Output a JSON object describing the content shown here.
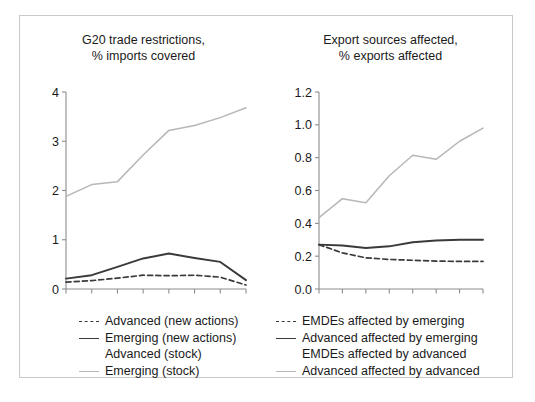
{
  "figure": {
    "background_color": "#ffffff",
    "frame_color": "#c9c9c9",
    "panels": [
      "left",
      "right"
    ]
  },
  "colors": {
    "dark_line": "#3a3a3a",
    "light_line": "#b7b7b7",
    "axis": "#8c8c8c",
    "text": "#1a1a1a",
    "white_line": "#ffffff"
  },
  "chart_data": [
    {
      "id": "left",
      "type": "line",
      "title": "G20 trade restrictions,\n% imports covered",
      "title_line_1": "G20 trade restrictions,",
      "title_line_2": "% imports covered",
      "xlabel": "",
      "ylabel": "",
      "ylim": [
        0,
        4
      ],
      "yticks": [
        0,
        1,
        2,
        3,
        4
      ],
      "ytick_labels": [
        "0",
        "1",
        "2",
        "3",
        "4"
      ],
      "x": [
        0,
        1,
        2,
        3,
        4,
        5,
        6,
        7
      ],
      "xticks": [
        0,
        1,
        2,
        3,
        4,
        5,
        6,
        7
      ],
      "xtick_labels": [
        "",
        "",
        "",
        "",
        "",
        "",
        "",
        ""
      ],
      "grid": false,
      "legend_position": "below",
      "series": [
        {
          "name": "Advanced (new actions)",
          "style": "dashed",
          "color": "#3a3a3a",
          "values": [
            0.14,
            0.17,
            0.22,
            0.28,
            0.27,
            0.28,
            0.24,
            0.08
          ]
        },
        {
          "name": "Emerging (new actions)",
          "style": "solid",
          "color": "#3a3a3a",
          "values": [
            0.21,
            0.28,
            0.45,
            0.62,
            0.72,
            0.63,
            0.55,
            0.18
          ]
        },
        {
          "name": "Advanced (stock)",
          "style": "solid",
          "color": "#ffffff",
          "values": [
            null,
            null,
            null,
            null,
            null,
            null,
            null,
            null
          ]
        },
        {
          "name": "Emerging (stock)",
          "style": "solid",
          "color": "#b7b7b7",
          "values": [
            1.88,
            2.12,
            2.18,
            2.72,
            3.22,
            3.32,
            3.48,
            3.68
          ]
        }
      ]
    },
    {
      "id": "right",
      "type": "line",
      "title": "Export sources affected,\n% exports affected",
      "title_line_1": "Export sources affected,",
      "title_line_2": "% exports affected",
      "xlabel": "",
      "ylabel": "",
      "ylim": [
        0.0,
        1.2
      ],
      "yticks": [
        0.0,
        0.2,
        0.4,
        0.6,
        0.8,
        1.0,
        1.2
      ],
      "ytick_labels": [
        "0.0",
        "0.2",
        "0.4",
        "0.6",
        "0.8",
        "1.0",
        "1.2"
      ],
      "x": [
        0,
        1,
        2,
        3,
        4,
        5,
        6,
        7
      ],
      "xticks": [
        0,
        1,
        2,
        3,
        4,
        5,
        6,
        7
      ],
      "xtick_labels": [
        "",
        "",
        "",
        "",
        "",
        "",
        "",
        ""
      ],
      "grid": false,
      "legend_position": "below",
      "series": [
        {
          "name": "EMDEs affected by emerging",
          "style": "dashed",
          "color": "#3a3a3a",
          "values": [
            0.27,
            0.22,
            0.19,
            0.18,
            0.175,
            0.17,
            0.168,
            0.168
          ]
        },
        {
          "name": "Advanced affected by emerging",
          "style": "solid",
          "color": "#3a3a3a",
          "values": [
            0.27,
            0.265,
            0.25,
            0.26,
            0.285,
            0.295,
            0.3,
            0.3
          ]
        },
        {
          "name": "EMDEs affected by advanced",
          "style": "solid",
          "color": "#ffffff",
          "values": [
            null,
            null,
            null,
            null,
            null,
            null,
            null,
            null
          ]
        },
        {
          "name": "Advanced affected by advanced",
          "style": "solid",
          "color": "#b7b7b7",
          "values": [
            0.435,
            0.55,
            0.525,
            0.69,
            0.815,
            0.79,
            0.9,
            0.98
          ]
        }
      ]
    }
  ],
  "left_panel": {
    "title_line_1": "G20 trade restrictions,",
    "title_line_2": "% imports covered",
    "ytick_labels": [
      "4",
      "3",
      "2",
      "1",
      "0"
    ],
    "legend": [
      {
        "key": "dashed",
        "label": "Advanced (new actions)"
      },
      {
        "key": "solid",
        "label": "Emerging (new actions)"
      },
      {
        "key": "blank",
        "label": "Advanced (stock)"
      },
      {
        "key": "light",
        "label": "Emerging (stock)"
      }
    ]
  },
  "right_panel": {
    "title_line_1": "Export sources affected,",
    "title_line_2": "% exports affected",
    "ytick_labels": [
      "1.2",
      "1.0",
      "0.8",
      "0.6",
      "0.4",
      "0.2",
      "0.0"
    ],
    "legend": [
      {
        "key": "dashed",
        "label": "EMDEs affected by emerging"
      },
      {
        "key": "solid",
        "label": "Advanced affected by emerging"
      },
      {
        "key": "blank",
        "label": "EMDEs affected by advanced"
      },
      {
        "key": "light",
        "label": "Advanced affected by advanced"
      }
    ]
  }
}
